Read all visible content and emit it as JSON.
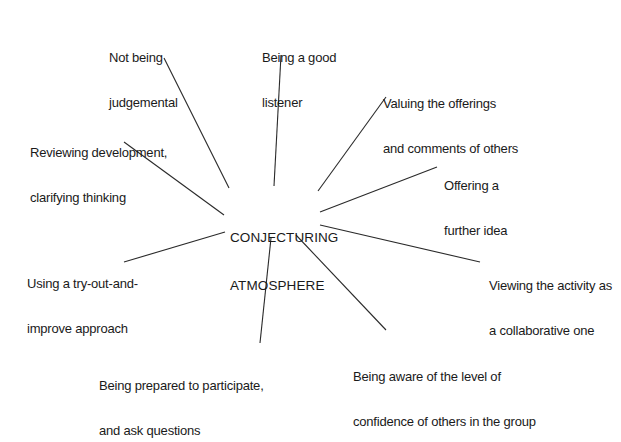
{
  "diagram": {
    "center": {
      "line1": "CONJECTURING",
      "line2": "ATMOSPHERE"
    },
    "nodes": [
      {
        "id": "not-judgemental",
        "line1": "Not being",
        "line2": "judgemental"
      },
      {
        "id": "good-listener",
        "line1": "Being a good",
        "line2": "listener"
      },
      {
        "id": "valuing-offerings",
        "line1": "Valuing the offerings",
        "line2": "and comments of others"
      },
      {
        "id": "further-idea",
        "line1": "Offering a",
        "line2": "further idea"
      },
      {
        "id": "collaborative",
        "line1": "Viewing the activity as",
        "line2": "a collaborative one"
      },
      {
        "id": "aware-confidence",
        "line1": "Being aware of the level of",
        "line2": "confidence of others in the group"
      },
      {
        "id": "prepared-participate",
        "line1": "Being prepared to participate,",
        "line2": "and ask questions"
      },
      {
        "id": "try-out-improve",
        "line1": "Using a try-out-and-",
        "line2": "improve approach"
      },
      {
        "id": "reviewing",
        "line1": "Reviewing development,",
        "line2": "clarifying thinking"
      }
    ],
    "line_color": "#2a2a2a"
  }
}
